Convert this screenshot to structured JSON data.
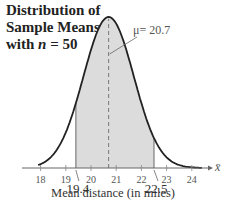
{
  "chart_data": {
    "type": "area",
    "title": "Distribution of Sample Means with n = 50",
    "title_lines": [
      "Distribution of",
      "Sample Means",
      "with "
    ],
    "title_n_var": "n",
    "title_n_value": " = 50",
    "xlabel": "Mean distance (in miles)",
    "x_axis_symbol": "x̄",
    "ylabel": "",
    "distribution": "normal",
    "mean": 20.7,
    "std_dev_approx": 1.0,
    "mean_annotation": "μ= 20.7",
    "shaded_region": {
      "from": 19.4,
      "to": 22.5
    },
    "shaded_labels": [
      "19.4",
      "22.5"
    ],
    "x_ticks": [
      18,
      19,
      20,
      21,
      22,
      23,
      24
    ],
    "xlim": [
      17.1,
      24.8
    ],
    "grid": false,
    "colors": {
      "curve": "#222222",
      "shade": "#dcdcdc",
      "axis": "#555555"
    }
  }
}
